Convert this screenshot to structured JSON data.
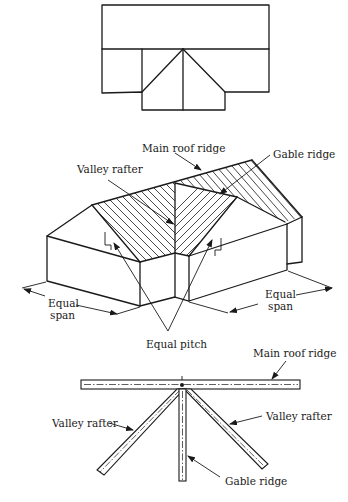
{
  "figure": {
    "plan_view": {
      "description": "Roof plan of T-shaped building with gable wing"
    },
    "isometric_view": {
      "labels": {
        "main_roof_ridge": "Main roof ridge",
        "gable_ridge": "Gable ridge",
        "valley_rafter": "Valley rafter",
        "equal_span_left_line1": "Equal",
        "equal_span_left_line2": "span",
        "equal_span_right_line1": "Equal",
        "equal_span_right_line2": "span",
        "equal_pitch": "Equal pitch"
      }
    },
    "framing_view": {
      "labels": {
        "main_roof_ridge": "Main roof ridge",
        "valley_rafter_left": "Valley rafter",
        "valley_rafter_right": "Valley rafter",
        "gable_ridge": "Gable ridge"
      }
    }
  },
  "colors": {
    "ink": "#1a1a1a",
    "paper": "#ffffff"
  }
}
